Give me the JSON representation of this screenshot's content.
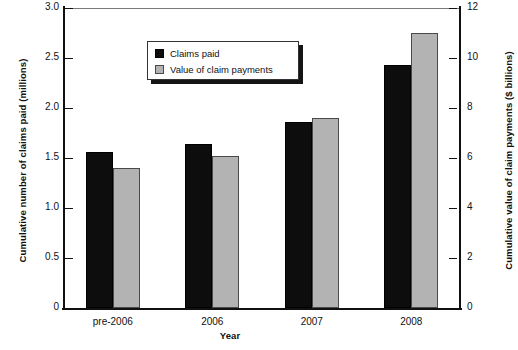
{
  "chart_data": {
    "type": "bar",
    "title": "",
    "xlabel": "Year",
    "ylabel": "Cumulative number of claims paid (millions)",
    "ylabel_right": "Cumulative value of claim payments ($ billions)",
    "categories": [
      "pre-2006",
      "2006",
      "2007",
      "2008"
    ],
    "series": [
      {
        "name": "Claims paid",
        "axis": "left",
        "color": "#0d0d0d",
        "values": [
          1.56,
          1.64,
          1.86,
          2.43
        ]
      },
      {
        "name": "Value of claim payments",
        "axis": "right",
        "color": "#b3b3b3",
        "values": [
          5.6,
          6.1,
          7.6,
          11.0
        ]
      }
    ],
    "ylim": [
      0,
      3.0
    ],
    "ylim_right": [
      0,
      12
    ],
    "yticks": [
      "0",
      "0.5",
      "1.0",
      "1.5",
      "2.0",
      "2.5",
      "3.0"
    ],
    "ytick_values": [
      0,
      0.5,
      1.0,
      1.5,
      2.0,
      2.5,
      3.0
    ],
    "yticks_right": [
      "0",
      "2",
      "4",
      "6",
      "8",
      "10",
      "12"
    ],
    "ytick_values_right": [
      0,
      2,
      4,
      6,
      8,
      10,
      12
    ],
    "grid": false,
    "legend_position": "upper-left-inside"
  },
  "legend": {
    "items": [
      {
        "label": "Claims paid",
        "swatch": "dark"
      },
      {
        "label": "Value of claim payments",
        "swatch": "light"
      }
    ]
  }
}
